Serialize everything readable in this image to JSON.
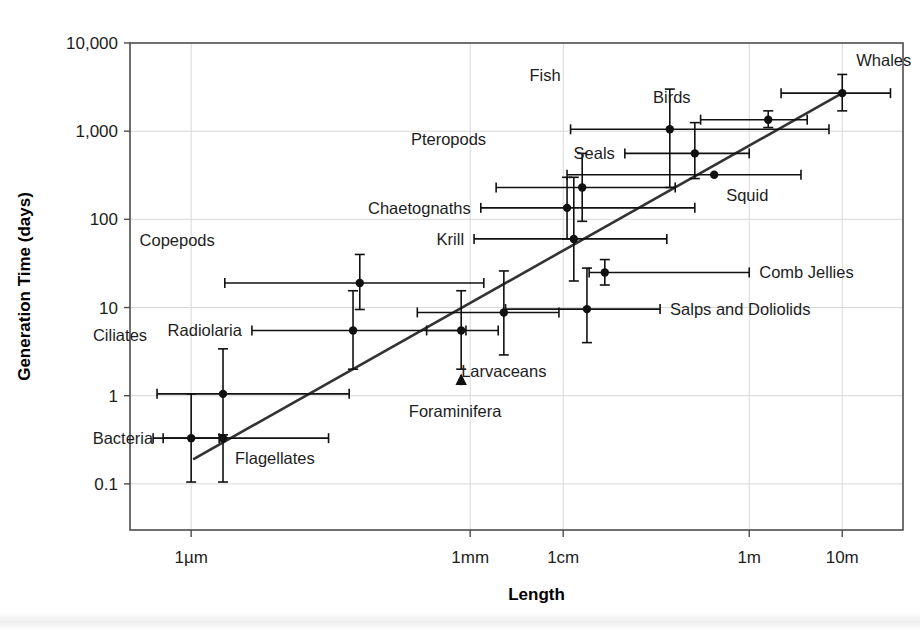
{
  "chart_data": {
    "type": "scatter",
    "title": "",
    "xlabel": "Length",
    "ylabel": "Generation Time (days)",
    "x_scale": "log",
    "y_scale": "log",
    "x_tick_labels": [
      "1µm",
      "1mm",
      "1cm",
      "1m",
      "10m"
    ],
    "x_tick_values": [
      1e-06,
      0.001,
      0.01,
      1,
      10
    ],
    "y_tick_labels": [
      "10,000",
      "1,000",
      "100",
      "10",
      "1",
      "0.1"
    ],
    "y_tick_values": [
      10000,
      1000,
      100,
      10,
      1,
      0.1
    ],
    "xlim": [
      2.2e-07,
      45
    ],
    "ylim": [
      0.03,
      10000
    ],
    "grid": true,
    "legend": "none",
    "trendline": {
      "x_start": 1.05e-06,
      "y_start": 0.19,
      "x_end": 10.0,
      "y_end": 2700
    },
    "points": [
      {
        "name": "Bacteria",
        "label": "Bacteria",
        "x": 1e-06,
        "y": 0.33,
        "x_low": 5e-07,
        "x_high": 2e-06,
        "y_low": 0.105,
        "y_high": 1.05,
        "label_pos": "left"
      },
      {
        "name": "Ciliates",
        "label": "Ciliates",
        "x": 2.2e-06,
        "y": 1.05,
        "x_low": 4.3e-07,
        "x_high": 5e-05,
        "y_low": 0.36,
        "y_high": 3.4,
        "label_pos": "left-above"
      },
      {
        "name": "Flagellates",
        "label": "Flagellates",
        "x": 2.2e-06,
        "y": 0.33,
        "x_low": 3.9e-07,
        "x_high": 3e-05,
        "y_low": 0.105,
        "y_high": 0.33,
        "label_pos": "right-below"
      },
      {
        "name": "Radiolaria",
        "label": "Radiolaria",
        "x": 5.5e-05,
        "y": 5.5,
        "x_low": 4.5e-06,
        "x_high": 0.0009,
        "y_low": 2.0,
        "y_high": 15.5,
        "label_pos": "left"
      },
      {
        "name": "Foraminifera",
        "label": "Foraminifera",
        "x": 0.0008,
        "y": 5.5,
        "x_low": 0.00034,
        "x_high": 0.002,
        "y_low": 2.0,
        "y_high": 15.5,
        "label_pos": "below-arrow"
      },
      {
        "name": "Copepods",
        "label": "Copepods",
        "x": 6.5e-05,
        "y": 19.0,
        "x_low": 2.3e-06,
        "x_high": 0.0014,
        "y_low": 9.5,
        "y_high": 40.0,
        "label_pos": "left-above"
      },
      {
        "name": "Larvaceans",
        "label": "Larvaceans",
        "x": 0.0023,
        "y": 8.8,
        "x_low": 0.00027,
        "x_high": 0.009,
        "y_low": 2.9,
        "y_high": 26.0,
        "label_pos": "below"
      },
      {
        "name": "Salps and Doliolids",
        "label": "Salps and Doliolids",
        "x": 0.018,
        "y": 9.6,
        "x_low": 0.0024,
        "x_high": 0.11,
        "y_low": 4.0,
        "y_high": 28.0,
        "label_pos": "right"
      },
      {
        "name": "Comb Jellies",
        "label": "Comb Jellies",
        "x": 0.028,
        "y": 25.0,
        "x_low": 0.019,
        "x_high": 1.0,
        "y_low": 18.0,
        "y_high": 35.0,
        "label_pos": "right"
      },
      {
        "name": "Krill",
        "label": "Krill",
        "x": 0.013,
        "y": 60.0,
        "x_low": 0.0011,
        "x_high": 0.13,
        "y_low": 20.0,
        "y_high": 300.0,
        "label_pos": "left"
      },
      {
        "name": "Chaetognaths",
        "label": "Chaetognaths",
        "x": 0.011,
        "y": 135.0,
        "x_low": 0.0013,
        "x_high": 0.26,
        "y_low": 60.0,
        "y_high": 300.0,
        "label_pos": "left"
      },
      {
        "name": "Pteropods",
        "label": "Pteropods",
        "x": 0.016,
        "y": 230.0,
        "x_low": 0.0019,
        "x_high": 0.16,
        "y_low": 95.0,
        "y_high": 560.0,
        "label_pos": "left-above"
      },
      {
        "name": "Squid",
        "label": "Squid",
        "x": 0.42,
        "y": 320.0,
        "x_low": 0.011,
        "x_high": 3.6,
        "y_low": 320.0,
        "y_high": 320.0,
        "label_pos": "right-below"
      },
      {
        "name": "Seals",
        "label": "Seals",
        "x": 0.26,
        "y": 560.0,
        "x_low": 0.046,
        "x_high": 1.0,
        "y_low": 290.0,
        "y_high": 1250.0,
        "label_pos": "left"
      },
      {
        "name": "Fish",
        "label": "Fish",
        "x": 0.14,
        "y": 1050.0,
        "x_low": 0.012,
        "x_high": 7.2,
        "y_low": 230.0,
        "y_high": 3000.0,
        "label_pos": "left-above"
      },
      {
        "name": "Birds",
        "label": "Birds",
        "x": 1.6,
        "y": 1350.0,
        "x_low": 0.3,
        "x_high": 4.2,
        "y_low": 1100.0,
        "y_high": 1700.0,
        "label_pos": "left-above"
      },
      {
        "name": "Whales",
        "label": "Whales",
        "x": 10.0,
        "y": 2700.0,
        "x_low": 2.2,
        "x_high": 33.0,
        "y_low": 1700.0,
        "y_high": 4400.0,
        "label_pos": "right-above"
      }
    ]
  },
  "labels": {
    "y_axis_title": "Generation Time (days)",
    "x_axis_title": "Length"
  }
}
